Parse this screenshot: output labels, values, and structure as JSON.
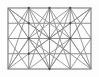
{
  "figure": {
    "name": "grid-diagonal-lattice-diagram",
    "type": "line-diagram",
    "title": "",
    "canvas": {
      "width": 99,
      "height": 77
    },
    "background_color": "#fdfdfd",
    "colors": {
      "grid_line": "#8e8e8e",
      "diagonal_line": "#8a8a8a",
      "border": "#7a7a7a",
      "vertex_dot": "#4a4a4a"
    },
    "stroke_widths": {
      "border": 1.1,
      "grid": 1.0,
      "diagonal": 0.85
    },
    "rect": {
      "x": 8,
      "y": 8,
      "width": 83,
      "height": 61
    },
    "columns": 4,
    "rows": 4,
    "x_grid": [
      8,
      28.75,
      49.5,
      70.25,
      91
    ],
    "y_grid": [
      8,
      23.25,
      38.5,
      53.75,
      69
    ],
    "vertex_dots": [
      {
        "x": 28.75,
        "y": 8
      },
      {
        "x": 49.5,
        "y": 8
      },
      {
        "x": 70.25,
        "y": 8
      },
      {
        "x": 28.75,
        "y": 38.5
      },
      {
        "x": 49.5,
        "y": 38.5
      },
      {
        "x": 70.25,
        "y": 38.5
      },
      {
        "x": 28.75,
        "y": 53.75
      },
      {
        "x": 49.5,
        "y": 69
      },
      {
        "x": 28.75,
        "y": 23.25
      },
      {
        "x": 70.25,
        "y": 23.25
      }
    ],
    "diagonals": [
      {
        "x1": 8,
        "y1": 8,
        "x2": 49.5,
        "y2": 38.5
      },
      {
        "x1": 8,
        "y1": 8,
        "x2": 28.75,
        "y2": 38.5
      },
      {
        "x1": 8,
        "y1": 8,
        "x2": 28.75,
        "y2": 23.25
      },
      {
        "x1": 8,
        "y1": 8,
        "x2": 49.5,
        "y2": 69
      },
      {
        "x1": 91,
        "y1": 8,
        "x2": 49.5,
        "y2": 38.5
      },
      {
        "x1": 91,
        "y1": 8,
        "x2": 70.25,
        "y2": 38.5
      },
      {
        "x1": 91,
        "y1": 8,
        "x2": 70.25,
        "y2": 23.25
      },
      {
        "x1": 91,
        "y1": 8,
        "x2": 49.5,
        "y2": 69
      },
      {
        "x1": 8,
        "y1": 69,
        "x2": 49.5,
        "y2": 38.5
      },
      {
        "x1": 8,
        "y1": 69,
        "x2": 28.75,
        "y2": 38.5
      },
      {
        "x1": 8,
        "y1": 69,
        "x2": 28.75,
        "y2": 8
      },
      {
        "x1": 8,
        "y1": 69,
        "x2": 49.5,
        "y2": 8
      },
      {
        "x1": 91,
        "y1": 69,
        "x2": 49.5,
        "y2": 38.5
      },
      {
        "x1": 91,
        "y1": 69,
        "x2": 70.25,
        "y2": 38.5
      },
      {
        "x1": 91,
        "y1": 69,
        "x2": 70.25,
        "y2": 8
      },
      {
        "x1": 91,
        "y1": 69,
        "x2": 49.5,
        "y2": 8
      },
      {
        "x1": 28.75,
        "y1": 8,
        "x2": 49.5,
        "y2": 38.5
      },
      {
        "x1": 70.25,
        "y1": 8,
        "x2": 49.5,
        "y2": 38.5
      },
      {
        "x1": 28.75,
        "y1": 8,
        "x2": 70.25,
        "y2": 38.5
      },
      {
        "x1": 70.25,
        "y1": 8,
        "x2": 28.75,
        "y2": 38.5
      },
      {
        "x1": 28.75,
        "y1": 38.5,
        "x2": 49.5,
        "y2": 69
      },
      {
        "x1": 70.25,
        "y1": 38.5,
        "x2": 49.5,
        "y2": 69
      },
      {
        "x1": 28.75,
        "y1": 38.5,
        "x2": 70.25,
        "y2": 69
      },
      {
        "x1": 70.25,
        "y1": 38.5,
        "x2": 28.75,
        "y2": 69
      },
      {
        "x1": 28.75,
        "y1": 23.25,
        "x2": 49.5,
        "y2": 38.5
      },
      {
        "x1": 70.25,
        "y1": 23.25,
        "x2": 49.5,
        "y2": 38.5
      },
      {
        "x1": 28.75,
        "y1": 53.75,
        "x2": 49.5,
        "y2": 38.5
      },
      {
        "x1": 70.25,
        "y1": 53.75,
        "x2": 49.5,
        "y2": 38.5
      },
      {
        "x1": 8,
        "y1": 38.5,
        "x2": 28.75,
        "y2": 8
      },
      {
        "x1": 8,
        "y1": 38.5,
        "x2": 28.75,
        "y2": 69
      },
      {
        "x1": 91,
        "y1": 38.5,
        "x2": 70.25,
        "y2": 8
      },
      {
        "x1": 91,
        "y1": 38.5,
        "x2": 70.25,
        "y2": 69
      },
      {
        "x1": 28.75,
        "y1": 8,
        "x2": 49.5,
        "y2": 69
      },
      {
        "x1": 70.25,
        "y1": 8,
        "x2": 49.5,
        "y2": 69
      },
      {
        "x1": 49.5,
        "y1": 8,
        "x2": 28.75,
        "y2": 69
      },
      {
        "x1": 49.5,
        "y1": 8,
        "x2": 70.25,
        "y2": 69
      }
    ]
  }
}
